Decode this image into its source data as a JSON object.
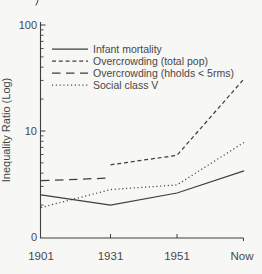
{
  "colors": {
    "ink": "#3f3f3f",
    "text": "#474747",
    "background": "#f7f7f5"
  },
  "y_axis": {
    "title": "Inequality Ratio (Log)",
    "tick_labels": [
      "100",
      "10",
      "0"
    ],
    "tick_values": [
      100,
      10,
      1
    ]
  },
  "x_axis": {
    "tick_labels": [
      "1901",
      "1931",
      "1951",
      "Now"
    ]
  },
  "chart_data": {
    "type": "line",
    "title": "",
    "xlabel": "",
    "ylabel": "Inequality Ratio (Log)",
    "y_scale": "log10",
    "ylim": [
      1,
      100
    ],
    "grid": false,
    "legend_position": "top-left-inside",
    "categories": [
      "1901",
      "1931",
      "1951",
      "Now"
    ],
    "series": [
      {
        "name": "Infant mortality",
        "style": "solid",
        "values": [
          2.5,
          2.0,
          2.6,
          4.2
        ]
      },
      {
        "name": "Overcrowding (total pop)",
        "style": "dashed-short",
        "values": [
          null,
          4.8,
          5.9,
          31
        ]
      },
      {
        "name": "Overcrowding (hholds < 5rms)",
        "style": "dashed-long",
        "values": [
          3.4,
          3.6,
          null,
          null
        ]
      },
      {
        "name": "Social class V",
        "style": "dotted",
        "values": [
          1.9,
          2.8,
          3.1,
          7.8
        ]
      }
    ]
  }
}
